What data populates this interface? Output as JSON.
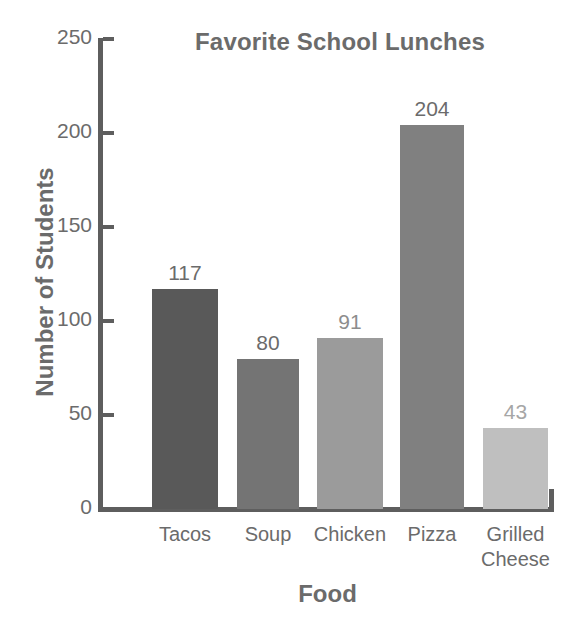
{
  "chart_data": {
    "type": "bar",
    "title": "Favorite School Lunches",
    "xlabel": "Food",
    "ylabel": "Number of Students",
    "categories": [
      "Tacos",
      "Soup",
      "Chicken",
      "Pizza",
      "Grilled\nCheese"
    ],
    "values": [
      117,
      80,
      91,
      204,
      43
    ],
    "value_labels": [
      "117",
      "80",
      "91",
      "204",
      "43"
    ],
    "bar_colors": [
      "#595959",
      "#747474",
      "#9b9b9b",
      "#808080",
      "#bfbfbf"
    ],
    "value_label_colors": [
      "#6b6b6b",
      "#6b6b6b",
      "#8d8d8d",
      "#6b6b6b",
      "#a6a6a6"
    ],
    "ylim": [
      0,
      250
    ],
    "yticks": [
      0,
      50,
      100,
      150,
      200,
      250
    ],
    "ytick_labels": [
      "0",
      "50",
      "100",
      "150",
      "200",
      "250"
    ],
    "grid": false,
    "legend": false,
    "axis_color": "#5e5e5e",
    "text_color": "#6b6b6b",
    "background": "#ffffff"
  }
}
